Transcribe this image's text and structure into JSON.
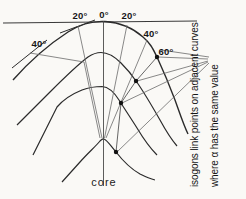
{
  "figure": {
    "background": "#faf9f6",
    "curve_color": "#2b2b2b",
    "thin_line_color": "#6b6b6b",
    "marker_color": "#111111"
  },
  "angle_labels": {
    "top_left_20": "20°",
    "top_0": "0°",
    "top_right_20": "20°",
    "right_40": "40°",
    "left_40": "40°",
    "right_60": "60°"
  },
  "core_label": "core",
  "caption": {
    "line1": "isogons link points on adjacent curves",
    "line2": "where α has the same value"
  },
  "isogon_points": [
    {
      "x": 157,
      "y": 57
    },
    {
      "x": 136,
      "y": 81
    },
    {
      "x": 121,
      "y": 103
    },
    {
      "x": 116,
      "y": 152
    }
  ]
}
